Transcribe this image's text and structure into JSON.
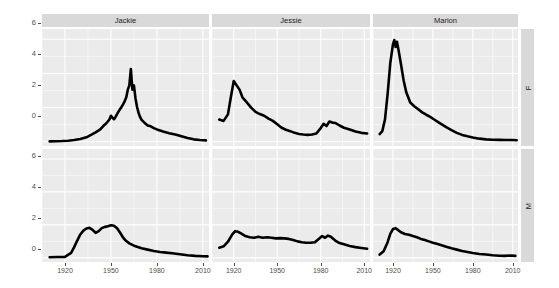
{
  "chart_data": {
    "type": "line",
    "title": "",
    "xlabel": "",
    "ylabel": "Number of People (thousands)",
    "xlim": [
      1905,
      2014
    ],
    "ylim": [
      -0.25,
      6.6
    ],
    "x_ticks": [
      1920,
      1950,
      1980,
      2010
    ],
    "x_tick_labels": [
      "1920",
      "1950",
      "1980",
      "2010"
    ],
    "y_ticks": [
      0,
      2,
      4,
      6
    ],
    "y_tick_labels": [
      "0",
      "2",
      "4",
      "6"
    ],
    "grid": "white major and minor gridlines on gray panel",
    "legend_position": "none",
    "facet_cols": [
      "Jackie",
      "Jessie",
      "Marion"
    ],
    "facet_rows": [
      "F",
      "M"
    ],
    "line_color": "#000000",
    "panel_background": "#ebebeb",
    "strip_background": "#d9d9d9",
    "series": [
      {
        "name": "Jackie-F",
        "facet_col": "Jackie",
        "facet_row": "F",
        "x": [
          1910,
          1914,
          1918,
          1922,
          1926,
          1930,
          1934,
          1937,
          1940,
          1943,
          1945,
          1947,
          1949,
          1950,
          1951,
          1952,
          1953,
          1954,
          1955,
          1956,
          1957,
          1958,
          1959,
          1960,
          1961,
          1962,
          1963,
          1964,
          1965,
          1966,
          1967,
          1968,
          1969,
          1970,
          1972,
          1974,
          1976,
          1978,
          1980,
          1984,
          1988,
          1992,
          1996,
          2000,
          2004,
          2008,
          2012
        ],
        "values": [
          0.02,
          0.03,
          0.04,
          0.06,
          0.1,
          0.16,
          0.26,
          0.4,
          0.55,
          0.72,
          0.92,
          1.08,
          1.3,
          1.52,
          1.4,
          1.32,
          1.45,
          1.62,
          1.78,
          1.92,
          2.05,
          2.2,
          2.38,
          2.6,
          3.05,
          3.3,
          4.25,
          3.05,
          3.3,
          2.55,
          2.05,
          1.7,
          1.45,
          1.28,
          1.1,
          0.95,
          0.9,
          0.8,
          0.72,
          0.6,
          0.5,
          0.42,
          0.32,
          0.22,
          0.14,
          0.1,
          0.08
        ]
      },
      {
        "name": "Jessie-F",
        "facet_col": "Jessie",
        "facet_row": "F",
        "x": [
          1910,
          1913,
          1916,
          1918,
          1920,
          1922,
          1924,
          1926,
          1929,
          1932,
          1935,
          1938,
          1941,
          1944,
          1947,
          1950,
          1953,
          1956,
          1959,
          1962,
          1965,
          1968,
          1971,
          1974,
          1977,
          1980,
          1982,
          1984,
          1986,
          1988,
          1990,
          1993,
          1996,
          2000,
          2004,
          2008,
          2012
        ],
        "values": [
          1.3,
          1.22,
          1.6,
          2.6,
          3.55,
          3.3,
          3.05,
          2.6,
          2.3,
          2.0,
          1.75,
          1.62,
          1.52,
          1.35,
          1.22,
          1.02,
          0.82,
          0.7,
          0.62,
          0.52,
          0.45,
          0.42,
          0.4,
          0.42,
          0.48,
          0.8,
          1.05,
          0.92,
          1.18,
          1.12,
          1.1,
          0.95,
          0.82,
          0.72,
          0.6,
          0.52,
          0.48
        ]
      },
      {
        "name": "Marion-F",
        "facet_col": "Marion",
        "facet_row": "F",
        "x": [
          1910,
          1912,
          1914,
          1916,
          1918,
          1920,
          1921,
          1922,
          1923,
          1924,
          1926,
          1928,
          1930,
          1933,
          1936,
          1939,
          1942,
          1945,
          1948,
          1951,
          1954,
          1957,
          1960,
          1964,
          1968,
          1972,
          1976,
          1980,
          1985,
          1990,
          1995,
          2000,
          2005,
          2010,
          2013
        ],
        "values": [
          0.45,
          0.62,
          1.3,
          2.8,
          4.6,
          5.7,
          5.95,
          5.55,
          5.85,
          5.45,
          4.55,
          3.6,
          2.9,
          2.3,
          2.08,
          1.9,
          1.72,
          1.58,
          1.45,
          1.3,
          1.15,
          1.0,
          0.85,
          0.68,
          0.52,
          0.4,
          0.32,
          0.25,
          0.18,
          0.14,
          0.12,
          0.11,
          0.1,
          0.1,
          0.09
        ]
      },
      {
        "name": "Jackie-M",
        "facet_col": "Jackie",
        "facet_row": "M",
        "x": [
          1910,
          1915,
          1920,
          1924,
          1926,
          1928,
          1930,
          1932,
          1934,
          1936,
          1938,
          1940,
          1942,
          1944,
          1946,
          1948,
          1950,
          1952,
          1954,
          1956,
          1958,
          1960,
          1962,
          1966,
          1970,
          1974,
          1978,
          1982,
          1986,
          1990,
          1995,
          2000,
          2005,
          2010,
          2013
        ],
        "values": [
          0.04,
          0.05,
          0.06,
          0.3,
          0.65,
          1.05,
          1.42,
          1.65,
          1.78,
          1.82,
          1.7,
          1.52,
          1.62,
          1.8,
          1.88,
          1.92,
          1.98,
          1.95,
          1.8,
          1.52,
          1.22,
          1.02,
          0.88,
          0.7,
          0.58,
          0.5,
          0.42,
          0.36,
          0.32,
          0.28,
          0.22,
          0.16,
          0.12,
          0.1,
          0.09
        ]
      },
      {
        "name": "Jessie-M",
        "facet_col": "Jessie",
        "facet_row": "M",
        "x": [
          1910,
          1913,
          1916,
          1919,
          1921,
          1923,
          1925,
          1928,
          1931,
          1934,
          1937,
          1940,
          1943,
          1946,
          1949,
          1952,
          1955,
          1958,
          1961,
          1964,
          1967,
          1970,
          1973,
          1976,
          1979,
          1981,
          1983,
          1985,
          1987,
          1990,
          1993,
          1996,
          2000,
          2004,
          2008,
          2012
        ],
        "values": [
          0.62,
          0.7,
          0.98,
          1.42,
          1.62,
          1.58,
          1.48,
          1.32,
          1.25,
          1.22,
          1.28,
          1.22,
          1.25,
          1.22,
          1.18,
          1.2,
          1.18,
          1.15,
          1.08,
          1.0,
          0.95,
          0.92,
          0.92,
          0.95,
          1.18,
          1.32,
          1.22,
          1.35,
          1.28,
          1.05,
          0.9,
          0.82,
          0.72,
          0.65,
          0.6,
          0.55
        ]
      },
      {
        "name": "Marion-M",
        "facet_col": "Marion",
        "facet_row": "M",
        "x": [
          1910,
          1913,
          1916,
          1918,
          1920,
          1922,
          1924,
          1926,
          1929,
          1932,
          1935,
          1938,
          1941,
          1944,
          1947,
          1950,
          1953,
          1956,
          1960,
          1964,
          1968,
          1972,
          1976,
          1980,
          1985,
          1990,
          1995,
          2000,
          2004,
          2008,
          2012
        ],
        "values": [
          0.2,
          0.4,
          0.95,
          1.45,
          1.75,
          1.8,
          1.68,
          1.55,
          1.45,
          1.4,
          1.32,
          1.25,
          1.15,
          1.08,
          1.0,
          0.92,
          0.85,
          0.78,
          0.68,
          0.58,
          0.5,
          0.42,
          0.36,
          0.3,
          0.24,
          0.2,
          0.16,
          0.13,
          0.12,
          0.14,
          0.12
        ]
      }
    ]
  },
  "axis": {
    "y_title": "Number of People (thousands)",
    "y_tick_labels": [
      "6",
      "4",
      "2",
      "0"
    ],
    "x_tick_labels": [
      "1920",
      "1950",
      "1980",
      "2010"
    ]
  },
  "strips": {
    "columns": [
      "Jackie",
      "Jessie",
      "Marion"
    ],
    "rows": [
      "F",
      "M"
    ]
  }
}
